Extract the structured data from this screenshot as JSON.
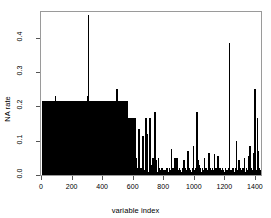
{
  "chart_data": {
    "type": "bar",
    "title": "",
    "xlabel": "variable index",
    "ylabel": "NA rate",
    "xlim": [
      0,
      1440
    ],
    "ylim": [
      0,
      0.475
    ],
    "grid": false,
    "legend": null,
    "xticks": [
      0,
      200,
      400,
      600,
      800,
      1000,
      1200,
      1400
    ],
    "xticklabels": [
      "0",
      "200",
      "400",
      "600",
      "800",
      "1000",
      "1200",
      "1400"
    ],
    "yticks": [
      0.0,
      0.1,
      0.2,
      0.3,
      0.4
    ],
    "yticklabels": [
      "0.0",
      "0.1",
      "0.2",
      "0.3",
      "0.4"
    ],
    "bar_color": "#000000",
    "n_variables": 1440,
    "x": [
      8,
      14,
      18,
      22,
      26,
      30,
      34,
      38,
      42,
      46,
      50,
      54,
      58,
      62,
      66,
      70,
      74,
      78,
      82,
      86,
      90,
      94,
      98,
      102,
      106,
      110,
      114,
      118,
      122,
      126,
      130,
      134,
      138,
      142,
      146,
      150,
      154,
      158,
      162,
      166,
      170,
      174,
      178,
      182,
      186,
      190,
      194,
      198,
      202,
      206,
      210,
      214,
      218,
      222,
      226,
      230,
      234,
      238,
      242,
      246,
      250,
      254,
      258,
      262,
      266,
      270,
      274,
      278,
      282,
      286,
      290,
      294,
      298,
      302,
      306,
      310,
      314,
      318,
      322,
      326,
      330,
      334,
      338,
      342,
      346,
      350,
      354,
      358,
      362,
      366,
      370,
      374,
      378,
      382,
      386,
      390,
      394,
      398,
      402,
      406,
      410,
      414,
      418,
      422,
      426,
      430,
      434,
      438,
      442,
      446,
      450,
      454,
      458,
      462,
      466,
      470,
      474,
      478,
      482,
      486,
      490,
      494,
      498,
      502,
      506,
      510,
      514,
      518,
      522,
      526,
      530,
      534,
      538,
      542,
      546,
      550,
      554,
      558,
      562,
      566,
      572,
      578,
      584,
      590,
      596,
      602,
      608,
      614,
      620,
      626,
      632,
      638,
      644,
      650,
      656,
      662,
      668,
      674,
      680,
      686,
      692,
      698,
      704,
      710,
      716,
      722,
      728,
      734,
      740,
      746,
      752,
      758,
      764,
      770,
      776,
      782,
      788,
      794,
      800,
      806,
      812,
      818,
      824,
      830,
      836,
      842,
      848,
      854,
      860,
      866,
      872,
      878,
      884,
      890,
      896,
      902,
      908,
      914,
      920,
      926,
      932,
      938,
      944,
      950,
      956,
      962,
      968,
      974,
      980,
      986,
      992,
      998,
      1004,
      1010,
      1016,
      1022,
      1028,
      1034,
      1040,
      1046,
      1052,
      1058,
      1064,
      1070,
      1076,
      1082,
      1088,
      1094,
      1100,
      1106,
      1112,
      1118,
      1124,
      1130,
      1136,
      1142,
      1148,
      1154,
      1160,
      1166,
      1172,
      1178,
      1184,
      1190,
      1196,
      1202,
      1208,
      1214,
      1220,
      1226,
      1232,
      1238,
      1244,
      1250,
      1256,
      1262,
      1268,
      1274,
      1280,
      1286,
      1292,
      1298,
      1304,
      1310,
      1316,
      1322,
      1328,
      1334,
      1340,
      1346,
      1352,
      1358,
      1364,
      1370,
      1376,
      1382,
      1388,
      1394,
      1400,
      1406,
      1412,
      1418,
      1424,
      1430
    ],
    "values": [
      0.215,
      0.215,
      0.215,
      0.04,
      0.215,
      0.215,
      0.01,
      0.215,
      0.03,
      0.215,
      0.215,
      0.215,
      0.02,
      0.215,
      0.215,
      0.01,
      0.215,
      0.215,
      0.06,
      0.215,
      0.23,
      0.215,
      0.215,
      0.03,
      0.215,
      0.215,
      0.215,
      0.16,
      0.215,
      0.215,
      0.01,
      0.215,
      0.215,
      0.215,
      0.05,
      0.215,
      0.215,
      0.215,
      0.02,
      0.215,
      0.215,
      0.215,
      0.215,
      0.04,
      0.215,
      0.215,
      0.215,
      0.215,
      0.215,
      0.03,
      0.215,
      0.215,
      0.215,
      0.215,
      0.215,
      0.215,
      0.05,
      0.215,
      0.215,
      0.215,
      0.215,
      0.215,
      0.02,
      0.215,
      0.215,
      0.215,
      0.215,
      0.215,
      0.215,
      0.215,
      0.01,
      0.215,
      0.215,
      0.23,
      0.465,
      0.215,
      0.215,
      0.215,
      0.215,
      0.215,
      0.215,
      0.215,
      0.215,
      0.215,
      0.215,
      0.03,
      0.215,
      0.215,
      0.215,
      0.215,
      0.06,
      0.215,
      0.215,
      0.215,
      0.215,
      0.215,
      0.02,
      0.215,
      0.215,
      0.215,
      0.03,
      0.215,
      0.215,
      0.165,
      0.215,
      0.04,
      0.215,
      0.215,
      0.215,
      0.215,
      0.03,
      0.215,
      0.215,
      0.215,
      0.215,
      0.215,
      0.215,
      0.215,
      0.03,
      0.215,
      0.215,
      0.25,
      0.215,
      0.215,
      0.215,
      0.215,
      0.03,
      0.215,
      0.215,
      0.215,
      0.215,
      0.02,
      0.215,
      0.215,
      0.215,
      0.215,
      0.165,
      0.215,
      0.215,
      0.04,
      0.165,
      0.165,
      0.165,
      0.165,
      0.165,
      0.07,
      0.165,
      0.165,
      0.05,
      0.02,
      0.01,
      0.135,
      0.015,
      0.02,
      0.01,
      0.115,
      0.015,
      0.01,
      0.165,
      0.165,
      0.12,
      0.01,
      0.02,
      0.165,
      0.03,
      0.01,
      0.05,
      0.015,
      0.185,
      0.045,
      0.02,
      0.01,
      0.05,
      0.02,
      0.01,
      0.015,
      0.02,
      0.01,
      0.015,
      0.015,
      0.01,
      0.02,
      0.015,
      0.01,
      0.02,
      0.015,
      0.075,
      0.01,
      0.02,
      0.015,
      0.05,
      0.045,
      0.05,
      0.015,
      0.01,
      0.02,
      0.015,
      0.01,
      0.02,
      0.015,
      0.045,
      0.02,
      0.01,
      0.015,
      0.07,
      0.01,
      0.02,
      0.015,
      0.01,
      0.02,
      0.085,
      0.015,
      0.01,
      0.02,
      0.185,
      0.045,
      0.03,
      0.02,
      0.015,
      0.01,
      0.02,
      0.015,
      0.05,
      0.01,
      0.02,
      0.015,
      0.01,
      0.065,
      0.02,
      0.015,
      0.01,
      0.02,
      0.015,
      0.06,
      0.01,
      0.02,
      0.015,
      0.055,
      0.01,
      0.02,
      0.015,
      0.01,
      0.02,
      0.015,
      0.01,
      0.02,
      0.015,
      0.01,
      0.015,
      0.02,
      0.385,
      0.015,
      0.01,
      0.02,
      0.015,
      0.01,
      0.02,
      0.1,
      0.015,
      0.01,
      0.045,
      0.02,
      0.015,
      0.01,
      0.02,
      0.015,
      0.05,
      0.01,
      0.02,
      0.015,
      0.055,
      0.01,
      0.085,
      0.02,
      0.015,
      0.01,
      0.065,
      0.25,
      0.02,
      0.015,
      0.165,
      0.07,
      0.02,
      0.015
    ]
  }
}
